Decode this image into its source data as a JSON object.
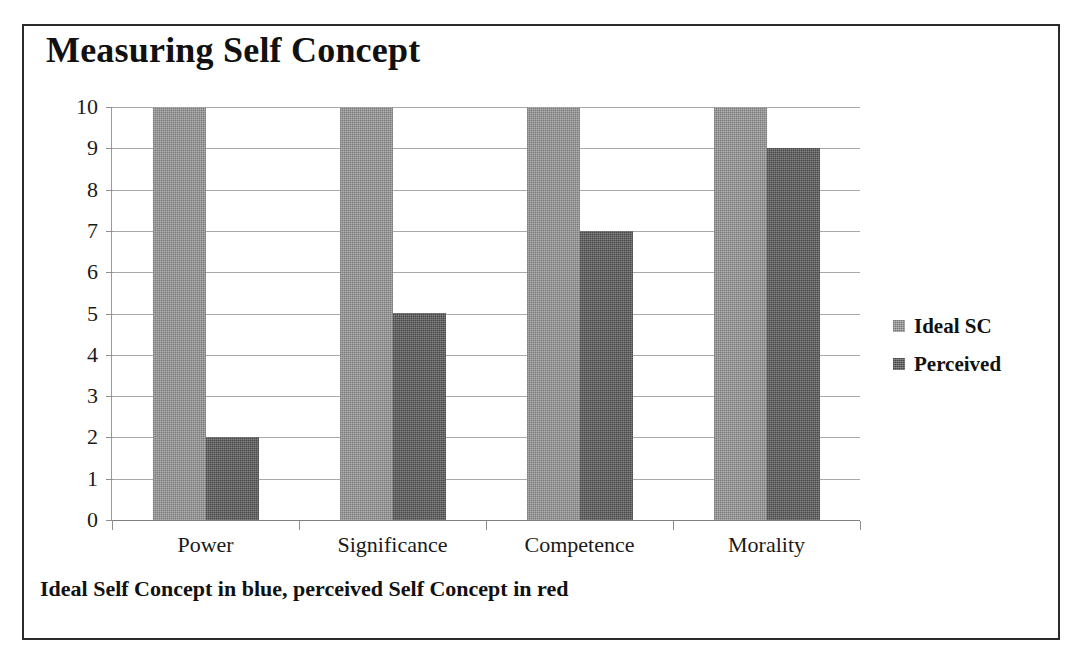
{
  "chart_data": {
    "type": "bar",
    "title": "Measuring Self Concept",
    "categories": [
      "Power",
      "Significance",
      "Competence",
      "Morality"
    ],
    "series": [
      {
        "name": "Ideal SC",
        "values": [
          10,
          10,
          10,
          10
        ],
        "color": "#8c8c8c"
      },
      {
        "name": "Perceived",
        "values": [
          2,
          5,
          7,
          9
        ],
        "color": "#575757"
      }
    ],
    "xlabel": "",
    "ylabel": "",
    "ylim": [
      0,
      10
    ],
    "y_ticks": [
      10,
      9,
      8,
      7,
      6,
      5,
      4,
      3,
      2,
      1,
      0
    ],
    "grid": true,
    "legend_position": "right",
    "caption": "Ideal Self Concept in blue, perceived Self Concept in red"
  },
  "legend": {
    "items": [
      {
        "label": "Ideal SC",
        "swatch": "legend-swatch-ideal"
      },
      {
        "label": "Perceived",
        "swatch": "legend-swatch-perceived"
      }
    ]
  }
}
